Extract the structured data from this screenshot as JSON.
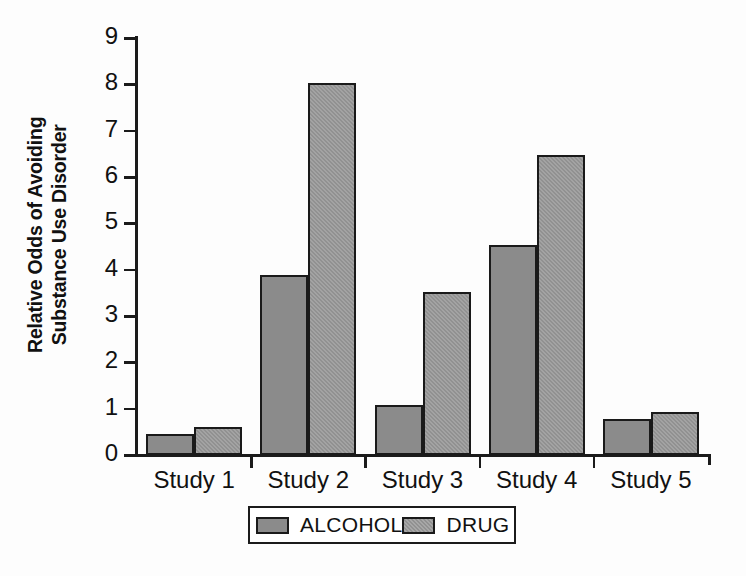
{
  "chart_data": {
    "type": "bar",
    "title": "",
    "xlabel": "",
    "ylabel": "Relative Odds of Avoiding Substance Use Disorder",
    "ylabel_line1": "Relative Odds of Avoiding",
    "ylabel_line2": "Substance Use Disorder",
    "categories": [
      "Study 1",
      "Study 2",
      "Study 3",
      "Study 4",
      "Study 5"
    ],
    "series": [
      {
        "name": "ALCOHOL",
        "values": [
          0.46,
          3.88,
          1.07,
          4.53,
          0.78
        ],
        "color": "#8b8b8b"
      },
      {
        "name": "DRUG",
        "values": [
          0.6,
          8.03,
          3.52,
          6.48,
          0.92
        ],
        "color": "#919191"
      }
    ],
    "ylim": [
      0,
      9
    ],
    "yticks": [
      "0",
      "1",
      "2",
      "3",
      "4",
      "5",
      "6",
      "7",
      "8",
      "9"
    ],
    "grid": false,
    "legend_position": "bottom-center"
  },
  "legend": {
    "entries": [
      {
        "label": "ALCOHOL"
      },
      {
        "label": "DRUG"
      }
    ]
  }
}
